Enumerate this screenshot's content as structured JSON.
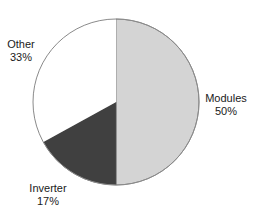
{
  "chart_data": {
    "type": "pie",
    "title": "",
    "categories": [
      "Modules",
      "Inverter",
      "Other"
    ],
    "values": [
      50,
      17,
      33
    ],
    "labels": [
      "Modules\n50%",
      "Inverter\n17%",
      "Other\n33%"
    ],
    "colors": [
      "#d4d4d4",
      "#404040",
      "#ffffff"
    ],
    "outline_color": "#8a8a8a",
    "start_angle_deg": 90,
    "direction": "clockwise",
    "legend": "none (inline labels)"
  },
  "labels": {
    "modules": {
      "name": "Modules",
      "pct": "50%"
    },
    "inverter": {
      "name": "Inverter",
      "pct": "17%"
    },
    "other": {
      "name": "Other",
      "pct": "33%"
    }
  }
}
